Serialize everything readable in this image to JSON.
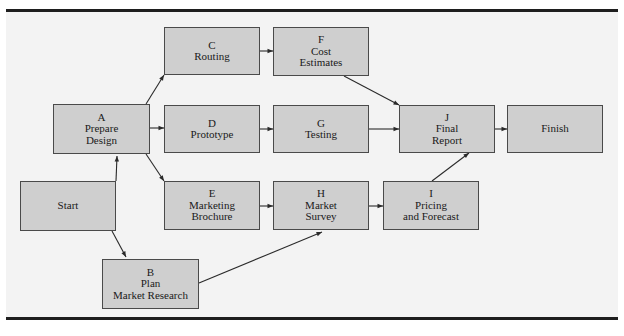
{
  "diagram": {
    "type": "activity-network",
    "nodes": [
      {
        "id": "start",
        "lines": [
          "Start"
        ]
      },
      {
        "id": "A",
        "lines": [
          "A",
          "Prepare",
          "Design"
        ]
      },
      {
        "id": "B",
        "lines": [
          "B",
          "Plan",
          "Market Research"
        ]
      },
      {
        "id": "C",
        "lines": [
          "C",
          "Routing"
        ]
      },
      {
        "id": "D",
        "lines": [
          "D",
          "Prototype"
        ]
      },
      {
        "id": "E",
        "lines": [
          "E",
          "Marketing",
          "Brochure"
        ]
      },
      {
        "id": "F",
        "lines": [
          "F",
          "Cost",
          "Estimates"
        ]
      },
      {
        "id": "G",
        "lines": [
          "G",
          "Testing"
        ]
      },
      {
        "id": "H",
        "lines": [
          "H",
          "Market",
          "Survey"
        ]
      },
      {
        "id": "I",
        "lines": [
          "I",
          "Pricing",
          "and Forecast"
        ]
      },
      {
        "id": "J",
        "lines": [
          "J",
          "Final",
          "Report"
        ]
      },
      {
        "id": "finish",
        "lines": [
          "Finish"
        ]
      }
    ],
    "edges": [
      {
        "from": "start",
        "to": "A"
      },
      {
        "from": "start",
        "to": "B"
      },
      {
        "from": "A",
        "to": "C"
      },
      {
        "from": "A",
        "to": "D"
      },
      {
        "from": "A",
        "to": "E"
      },
      {
        "from": "B",
        "to": "H"
      },
      {
        "from": "C",
        "to": "F"
      },
      {
        "from": "D",
        "to": "G"
      },
      {
        "from": "E",
        "to": "H"
      },
      {
        "from": "F",
        "to": "J"
      },
      {
        "from": "G",
        "to": "J"
      },
      {
        "from": "H",
        "to": "I"
      },
      {
        "from": "I",
        "to": "J"
      },
      {
        "from": "J",
        "to": "finish"
      }
    ],
    "colors": {
      "node_fill": "#cfcfcf",
      "node_border": "#4a4a4a",
      "edge": "#2a2a2a",
      "background": "#f3f3f3",
      "rule": "#1e1e1e"
    }
  }
}
